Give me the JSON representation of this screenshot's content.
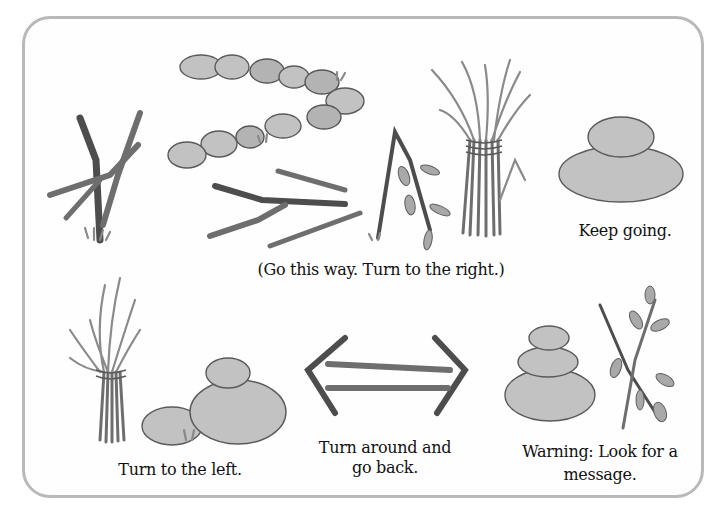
{
  "figure": {
    "signs": [
      {
        "id": "go-this-way",
        "caption": "(Go this way. Turn to the right.)",
        "materials": [
          "crossed sticks",
          "line of stones",
          "sticks",
          "bent branch",
          "grass bundle"
        ]
      },
      {
        "id": "keep-going",
        "caption": "Keep going.",
        "materials": [
          "two stacked stones"
        ]
      },
      {
        "id": "turn-left",
        "caption": "Turn to the left.",
        "materials": [
          "grass bundle",
          "stones"
        ]
      },
      {
        "id": "turn-around",
        "caption_line1": "Turn around and",
        "caption_line2": "go back.",
        "materials": [
          "sticks in double-arrow shape"
        ]
      },
      {
        "id": "warning",
        "caption_line1": "Warning: Look for a",
        "caption_line2": "message.",
        "materials": [
          "three stacked stones",
          "crossed leafy branches"
        ]
      }
    ]
  },
  "colors": {
    "frame_border": "#b9b9b9",
    "text": "#111111",
    "stone_fill": "#c2c2c2",
    "stick": "#6e6e6e"
  }
}
